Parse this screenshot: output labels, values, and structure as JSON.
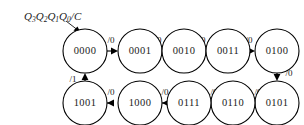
{
  "diagram": {
    "kind": "state-transition-diagram",
    "caption": {
      "prefix": "Q",
      "terms": [
        {
          "base": "Q",
          "sub": "3"
        },
        {
          "base": "Q",
          "sub": "2"
        },
        {
          "base": "Q",
          "sub": "1"
        },
        {
          "base": "Q",
          "sub": "0"
        }
      ],
      "separator": "/",
      "output": "C",
      "full_text": "Q3Q2Q1Q0/C"
    },
    "colors": {
      "stroke": "#000000",
      "text": "#1a1a1a",
      "background": "#ffffff"
    },
    "states": [
      {
        "id": "s0",
        "label": "0000",
        "cx": 85,
        "cy": 51,
        "r": 22,
        "row": "top"
      },
      {
        "id": "s1",
        "label": "0001",
        "cx": 140,
        "cy": 51,
        "r": 22,
        "row": "top"
      },
      {
        "id": "s2",
        "label": "0010",
        "cx": 184,
        "cy": 51,
        "r": 22,
        "row": "top"
      },
      {
        "id": "s3",
        "label": "0011",
        "cx": 228,
        "cy": 51,
        "r": 22,
        "row": "top"
      },
      {
        "id": "s4",
        "label": "0100",
        "cx": 277,
        "cy": 51,
        "r": 22,
        "row": "top"
      },
      {
        "id": "s5",
        "label": "0101",
        "cx": 277,
        "cy": 103,
        "r": 22,
        "row": "bottom"
      },
      {
        "id": "s6",
        "label": "0110",
        "cx": 233,
        "cy": 103,
        "r": 22,
        "row": "bottom"
      },
      {
        "id": "s7",
        "label": "0111",
        "cx": 189,
        "cy": 103,
        "r": 22,
        "row": "bottom"
      },
      {
        "id": "s8",
        "label": "1000",
        "cx": 140,
        "cy": 103,
        "r": 22,
        "row": "bottom"
      },
      {
        "id": "s9",
        "label": "1001",
        "cx": 85,
        "cy": 103,
        "r": 22,
        "row": "bottom"
      }
    ],
    "transitions": [
      {
        "from": "s0",
        "to": "s1",
        "label": "/0",
        "direction": "right"
      },
      {
        "from": "s1",
        "to": "s2",
        "label": "/0",
        "direction": "right"
      },
      {
        "from": "s2",
        "to": "s3",
        "label": "/0",
        "direction": "right"
      },
      {
        "from": "s3",
        "to": "s4",
        "label": "/0",
        "direction": "right"
      },
      {
        "from": "s4",
        "to": "s5",
        "label": "/0",
        "direction": "down"
      },
      {
        "from": "s5",
        "to": "s6",
        "label": "/0",
        "direction": "left"
      },
      {
        "from": "s6",
        "to": "s7",
        "label": "/0",
        "direction": "left"
      },
      {
        "from": "s7",
        "to": "s8",
        "label": "/0",
        "direction": "left"
      },
      {
        "from": "s8",
        "to": "s9",
        "label": "/0",
        "direction": "left"
      },
      {
        "from": "s9",
        "to": "s0",
        "label": "/1",
        "direction": "up"
      }
    ]
  }
}
